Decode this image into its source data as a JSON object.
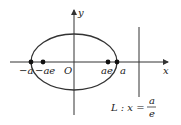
{
  "diagram": {
    "axes": {
      "x_label": "x",
      "y_label": "y",
      "origin_label": "O"
    },
    "points": [
      {
        "name": "left-vertex",
        "label": "−a"
      },
      {
        "name": "left-focus",
        "label": "−ae"
      },
      {
        "name": "right-focus",
        "label": "ae"
      },
      {
        "name": "right-vertex",
        "label": "a"
      }
    ],
    "directrix": {
      "prefix": "L : x =",
      "numerator": "a",
      "denominator": "e"
    },
    "colors": {
      "stroke": "#333333",
      "point": "#111111",
      "text": "#222222"
    }
  }
}
